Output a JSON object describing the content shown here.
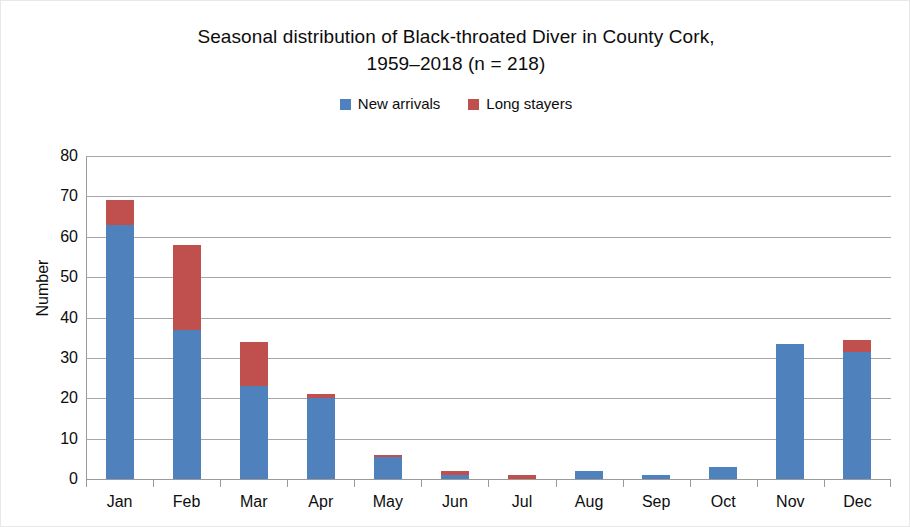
{
  "chart_data": {
    "type": "bar",
    "subtype": "stacked-column",
    "title": "Seasonal distribution of Black-throated Diver in County Cork, 1959–2018 (n = 218)",
    "title_lines": [
      "Seasonal distribution of Black-throated Diver in County Cork,",
      "1959–2018 (n = 218)"
    ],
    "xlabel": "",
    "ylabel": "Number",
    "ylim": [
      0,
      80
    ],
    "ytick_step": 10,
    "yticks": [
      80,
      70,
      60,
      50,
      40,
      30,
      20,
      10,
      0
    ],
    "grid": true,
    "legend_position": "top-center",
    "categories": [
      "Jan",
      "Feb",
      "Mar",
      "Apr",
      "May",
      "Jun",
      "Jul",
      "Aug",
      "Sep",
      "Oct",
      "Nov",
      "Dec"
    ],
    "series": [
      {
        "name": "New arrivals",
        "color": "#4F81BD",
        "values": [
          63,
          37,
          23,
          20,
          5.5,
          1,
          0,
          2,
          1,
          3,
          33.5,
          31.5
        ]
      },
      {
        "name": "Long stayers",
        "color": "#C0504D",
        "values": [
          6,
          21,
          11,
          1,
          0.5,
          1,
          1,
          0,
          0,
          0,
          0,
          3
        ]
      }
    ],
    "totals": [
      69,
      58,
      34,
      21,
      6,
      2,
      1,
      2,
      1,
      3,
      33.5,
      34.5
    ]
  },
  "legend": {
    "entries": [
      {
        "label": "New arrivals",
        "color": "#4F81BD"
      },
      {
        "label": "Long stayers",
        "color": "#C0504D"
      }
    ]
  }
}
